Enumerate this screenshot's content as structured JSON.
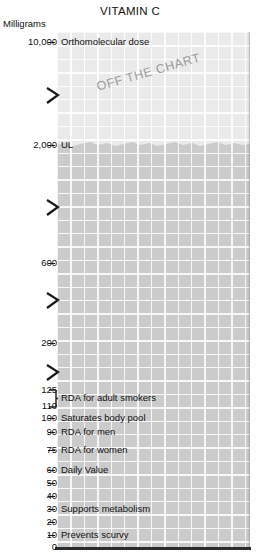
{
  "chart": {
    "title": "VITAMIN C",
    "unit_label": "Milligrams",
    "watermark": "OFF THE CHART"
  },
  "chart_data": {
    "type": "bar",
    "title": "VITAMIN C",
    "xlabel": "",
    "ylabel": "Milligrams",
    "axis_note": "Vertical axis is broken/compressed at four points; scale is non-linear",
    "grid": true,
    "legend": "none",
    "ylim": [
      0,
      10000
    ],
    "tick_values": [
      10000,
      2000,
      600,
      200,
      125,
      110,
      100,
      90,
      75,
      60,
      50,
      40,
      30,
      20,
      10,
      0
    ],
    "tick_labels": [
      "10,000",
      "2,000",
      "600",
      "200",
      "125",
      "110",
      "100",
      "90",
      "75",
      "60",
      "50",
      "40",
      "30",
      "20",
      "10",
      "0"
    ],
    "annotations": [
      {
        "value": 10000,
        "label": "Orthomolecular dose"
      },
      {
        "value": 2000,
        "label": "UL"
      },
      {
        "value": 125,
        "label": "RDA for adult smokers",
        "range": [
          110,
          125
        ]
      },
      {
        "value": 100,
        "label": "Saturates body pool"
      },
      {
        "value": 90,
        "label": "RDA for men"
      },
      {
        "value": 75,
        "label": "RDA for women"
      },
      {
        "value": 60,
        "label": "Daily Value"
      },
      {
        "value": 30,
        "label": "Supports metabolism"
      },
      {
        "value": 10,
        "label": "Prevents scurvy"
      }
    ],
    "axis_breaks": 4
  },
  "ticks": [
    {
      "label": "10,000",
      "y": 42,
      "dash": true
    },
    {
      "label": "2,000",
      "y": 145,
      "dash": true
    },
    {
      "label": "600",
      "y": 263,
      "dash": true
    },
    {
      "label": "200",
      "y": 343,
      "dash": true
    },
    {
      "label": "125",
      "y": 390,
      "dash": false
    },
    {
      "label": "110",
      "y": 406,
      "dash": false
    },
    {
      "label": "100",
      "y": 418,
      "dash": true
    },
    {
      "label": "90",
      "y": 432,
      "dash": true
    },
    {
      "label": "75",
      "y": 450,
      "dash": true
    },
    {
      "label": "60",
      "y": 470,
      "dash": true
    },
    {
      "label": "50",
      "y": 483,
      "dash": true
    },
    {
      "label": "40",
      "y": 496,
      "dash": true
    },
    {
      "label": "30",
      "y": 509,
      "dash": true
    },
    {
      "label": "20",
      "y": 522,
      "dash": true
    },
    {
      "label": "10",
      "y": 535,
      "dash": true
    },
    {
      "label": "0",
      "y": 547,
      "dash": false
    }
  ],
  "callouts": [
    {
      "text": "Orthomolecular dose",
      "x": 61,
      "y": 42
    },
    {
      "text": "UL",
      "x": 61,
      "y": 145
    },
    {
      "text": "RDA for adult smokers",
      "x": 61,
      "y": 398
    },
    {
      "text": "Saturates body pool",
      "x": 61,
      "y": 418
    },
    {
      "text": "RDA for men",
      "x": 61,
      "y": 432
    },
    {
      "text": "RDA for women",
      "x": 61,
      "y": 450
    },
    {
      "text": "Daily Value",
      "x": 61,
      "y": 470
    },
    {
      "text": "Supports metabolism",
      "x": 61,
      "y": 509
    },
    {
      "text": "Prevents scurvy",
      "x": 61,
      "y": 535
    }
  ],
  "breaks": [
    {
      "y": 87
    },
    {
      "y": 199
    },
    {
      "y": 292
    },
    {
      "y": 364
    }
  ],
  "colors": {
    "plot_lower": "#cbcbcb",
    "plot_upper": "#eaeaea",
    "gridline": "#ffffff",
    "baseline": "#2b2b2b",
    "text": "#111111",
    "watermark": "#9a9a9a"
  }
}
